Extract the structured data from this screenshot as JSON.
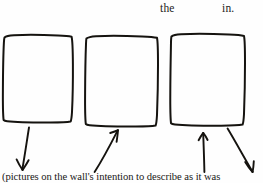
{
  "page": {
    "width": 263,
    "height": 183,
    "background_color": "#fefefe",
    "ink_color": "#15130f",
    "text_color": "#1d1c1a",
    "kind": "scanned-document-fragment"
  },
  "top_line": {
    "fragments": [
      {
        "text": "the",
        "x": 160,
        "y": 2
      },
      {
        "text": "in.",
        "x": 222,
        "y": 2
      }
    ]
  },
  "diagram": {
    "frames": [
      {
        "label": "frame-1",
        "x": 3,
        "y": 35,
        "width": 70,
        "height": 87
      },
      {
        "label": "frame-2",
        "x": 85,
        "y": 36,
        "width": 73,
        "height": 90
      },
      {
        "label": "frame-3",
        "x": 170,
        "y": 34,
        "width": 74,
        "height": 91
      }
    ],
    "arrows": [
      {
        "label": "arrow-1",
        "direction": "down-left",
        "from_x": 28,
        "from_y": 127,
        "to_x": 22,
        "to_y": 170
      },
      {
        "label": "arrow-2",
        "direction": "up-right",
        "from_x": 95,
        "from_y": 172,
        "to_x": 118,
        "to_y": 130
      },
      {
        "label": "arrow-3",
        "direction": "up",
        "from_x": 204,
        "from_y": 172,
        "to_x": 203,
        "to_y": 133
      },
      {
        "label": "arrow-4",
        "direction": "down-right",
        "from_x": 228,
        "from_y": 128,
        "to_x": 253,
        "to_y": 172
      }
    ]
  },
  "caption": {
    "text": "(pictures on the wall's intention to describe as it was"
  }
}
